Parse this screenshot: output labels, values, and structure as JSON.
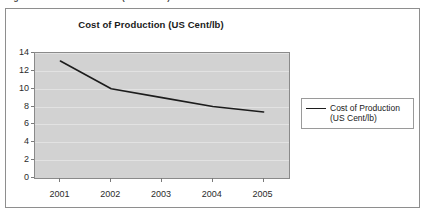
{
  "caption": {
    "text": "Figure 1: Cost of Production (US Cent/lb)"
  },
  "chart": {
    "title": "Cost of Production (US Cent/lb)",
    "legend_label_line1": "Cost of Production",
    "legend_label_line2": "(US Cent/lb)",
    "colors": {
      "plot_background": "#d2d2d2",
      "gridline": "#e2e2e2",
      "series_line": "#1c1c1c",
      "axis": "#8a8a8a",
      "frame_border": "#8e8e8e",
      "text": "#1a1a1a"
    }
  },
  "chart_data": {
    "type": "line",
    "title": "Cost of Production (US Cent/lb)",
    "xlabel": "",
    "ylabel": "",
    "categories": [
      "2001",
      "2002",
      "2003",
      "2004",
      "2005"
    ],
    "series": [
      {
        "name": "Cost of Production (US Cent/lb)",
        "values": [
          13.1,
          10.0,
          9.0,
          8.0,
          7.4
        ]
      }
    ],
    "ylim": [
      0,
      14
    ],
    "ytick_values": [
      0,
      2,
      4,
      6,
      8,
      10,
      12,
      14
    ],
    "ytick_labels": [
      "0",
      "2",
      "4",
      "6",
      "8",
      "10",
      "12",
      "14"
    ],
    "xtick_labels": [
      "2001",
      "2002",
      "2003",
      "2004",
      "2005"
    ],
    "grid": true,
    "grid_axis": "y",
    "legend": true,
    "legend_position": "right",
    "markers": false
  }
}
